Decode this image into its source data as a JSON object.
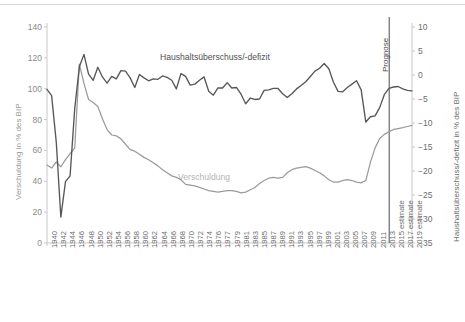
{
  "chart_data": {
    "type": "line",
    "title": "",
    "xlabel": "",
    "grid": false,
    "legend_position": "inline-annotation",
    "axes": {
      "left": {
        "label": "Verschuldung in % des BIP",
        "ticks": [
          0,
          20,
          40,
          60,
          80,
          100,
          120,
          140
        ],
        "ylim": [
          0,
          140
        ]
      },
      "right": {
        "label": "Haushaltsüberschuss/-defizit in % des BIP",
        "ticks": [
          10,
          5,
          0,
          -5,
          -10,
          -15,
          -20,
          -25,
          -30,
          -35
        ],
        "ylim": [
          -35,
          10
        ]
      }
    },
    "annotations": [
      {
        "name": "forecast-divider",
        "text": "Prognose",
        "at_x": "2013/2015 estimate boundary"
      },
      {
        "name": "series-label-deficit",
        "text": "Haushaltsüberschuss/-defizit"
      },
      {
        "name": "series-label-debt",
        "text": "Verschuldung"
      }
    ],
    "x_tick_labels": [
      "1940",
      "1942",
      "1944",
      "1946",
      "1948",
      "1950",
      "1952",
      "1954",
      "1956",
      "1958",
      "1960",
      "1962",
      "1964",
      "1966",
      "1968",
      "1970",
      "1972",
      "1974",
      "1976",
      "1977",
      "1979",
      "1981",
      "1983",
      "1985",
      "1987",
      "1989",
      "1991",
      "1993",
      "1995",
      "1997",
      "1999",
      "2001",
      "2003",
      "2005",
      "2007",
      "2009",
      "2011",
      "2013",
      "2015 estimate",
      "2017 estimate",
      "2019 estimate"
    ],
    "x_values": [
      1940,
      1941,
      1942,
      1943,
      1944,
      1945,
      1946,
      1947,
      1948,
      1949,
      1950,
      1951,
      1952,
      1953,
      1954,
      1955,
      1956,
      1957,
      1958,
      1959,
      1960,
      1961,
      1962,
      1963,
      1964,
      1965,
      1966,
      1967,
      1968,
      1969,
      1970,
      1971,
      1972,
      1973,
      1974,
      1975,
      1976,
      1977,
      1978,
      1979,
      1980,
      1981,
      1982,
      1983,
      1984,
      1985,
      1986,
      1987,
      1988,
      1989,
      1990,
      1991,
      1992,
      1993,
      1994,
      1995,
      1996,
      1997,
      1998,
      1999,
      2000,
      2001,
      2002,
      2003,
      2004,
      2005,
      2006,
      2007,
      2008,
      2009,
      2010,
      2011,
      2012,
      2013,
      2014,
      2015,
      2016,
      2017,
      2018,
      2019
    ],
    "series": [
      {
        "name": "Verschuldung",
        "axis": "left",
        "unit": "% des BIP",
        "color": "#9b9b9b",
        "values": [
          50.5,
          48.6,
          52.5,
          49.4,
          54.0,
          58.0,
          61.5,
          116.0,
          103.5,
          93.0,
          91.0,
          88.5,
          80.5,
          73.5,
          70.0,
          69.5,
          67.5,
          64.0,
          60.5,
          59.5,
          57.5,
          55.5,
          54.0,
          52.0,
          50.0,
          47.5,
          45.5,
          43.5,
          42.5,
          41.0,
          38.0,
          37.5,
          37.0,
          36.0,
          35.0,
          34.0,
          33.5,
          33.0,
          33.5,
          34.0,
          34.0,
          33.5,
          32.5,
          33.0,
          34.5,
          36.0,
          38.5,
          40.5,
          42.0,
          42.5,
          42.0,
          42.5,
          45.5,
          47.5,
          48.5,
          49.0,
          49.5,
          48.5,
          47.0,
          45.5,
          43.5,
          41.0,
          39.5,
          39.5,
          40.5,
          41.0,
          40.5,
          39.5,
          39.0,
          40.5,
          52.3,
          61.5,
          67.7,
          70.4,
          72.0,
          73.6,
          74.2,
          74.8,
          75.5,
          76.2
        ]
      },
      {
        "name": "Haushaltsüberschuss/-defizit",
        "axis": "right",
        "unit": "% des BIP",
        "color": "#575757",
        "values": [
          -3.0,
          -4.3,
          -13.9,
          -29.6,
          -22.2,
          -21.0,
          -7.0,
          1.7,
          4.3,
          0.2,
          -1.1,
          1.6,
          -0.4,
          -1.7,
          -0.3,
          -0.8,
          0.9,
          0.8,
          -0.6,
          -2.6,
          0.1,
          -0.6,
          -1.2,
          -0.8,
          -0.9,
          -0.2,
          -0.5,
          -1.1,
          -2.9,
          0.3,
          -0.3,
          -2.1,
          -1.9,
          -1.1,
          -0.4,
          -3.4,
          -4.2,
          -2.7,
          -2.7,
          -1.6,
          -2.7,
          -2.6,
          -4.0,
          -6.0,
          -4.8,
          -5.1,
          -5.0,
          -3.2,
          -3.1,
          -2.8,
          -2.8,
          -3.9,
          -4.7,
          -3.9,
          -2.9,
          -2.2,
          -1.4,
          -0.3,
          0.8,
          1.4,
          2.4,
          1.3,
          -1.5,
          -3.4,
          -3.5,
          -2.6,
          -1.9,
          -1.2,
          -3.1,
          -9.8,
          -8.7,
          -8.5,
          -6.8,
          -4.1,
          -2.8,
          -2.5,
          -2.4,
          -2.9,
          -3.2,
          -3.3
        ]
      }
    ]
  }
}
